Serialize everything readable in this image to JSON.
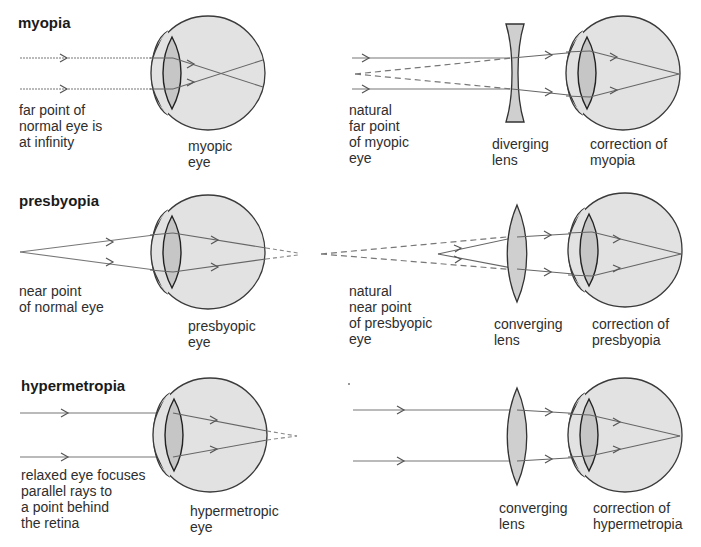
{
  "rows": [
    {
      "title": "myopia",
      "left_caption": "far point of\nnormal eye is\nat infinity",
      "eye_caption": "myopic\neye",
      "point_caption": "natural\nfar point\nof myopic\neye",
      "lens_caption": "diverging\nlens",
      "correction_caption": "correction of\nmyopia"
    },
    {
      "title": "presbyopia",
      "left_caption": "near point\nof normal eye",
      "eye_caption": "presbyopic\neye",
      "point_caption": "natural\nnear point\nof presbyopic\neye",
      "lens_caption": "converging\nlens",
      "correction_caption": "correction of\npresbyopia"
    },
    {
      "title": "hypermetropia",
      "left_caption": "relaxed eye focuses\nparallel rays to\na point behind\nthe retina",
      "eye_caption": "hypermetropic\neye",
      "lens_caption": "converging\nlens",
      "correction_caption": "correction of\nhypermetropia"
    }
  ],
  "colors": {
    "eye_fill": "#e2e2e2",
    "lens_fill": "#c9c9c9",
    "outline": "#3a3a3a",
    "ray": "#6a6a6a"
  }
}
